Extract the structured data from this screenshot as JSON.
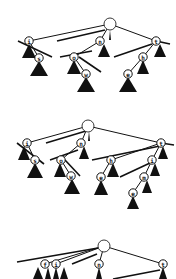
{
  "diagram": {
    "type": "trie-insertion-sequence",
    "panels": [
      {
        "id": "panel-1",
        "root": {
          "x": 110,
          "y": 24,
          "r": 6
        },
        "nodes": [
          {
            "id": "i",
            "label": "i",
            "x": 29,
            "y": 41
          },
          {
            "id": "s",
            "label": "s",
            "x": 39,
            "y": 58
          },
          {
            "id": "n",
            "label": "n",
            "x": 100,
            "y": 41
          },
          {
            "id": "o",
            "label": "o",
            "x": 74,
            "y": 57
          },
          {
            "id": "w",
            "label": "w",
            "x": 86,
            "y": 74
          },
          {
            "id": "t",
            "label": "t",
            "x": 156,
            "y": 41
          },
          {
            "id": "h",
            "label": "h",
            "x": 143,
            "y": 57
          },
          {
            "id": "e",
            "label": "e",
            "x": 128,
            "y": 74
          }
        ],
        "edges": [
          [
            "root",
            "i"
          ],
          [
            "root",
            "n"
          ],
          [
            "root",
            "t"
          ],
          [
            "i",
            "s"
          ],
          [
            "n",
            "o"
          ],
          [
            "o",
            "w"
          ],
          [
            "t",
            "h"
          ],
          [
            "h",
            "e"
          ]
        ],
        "slashes": [
          [
            18,
            41,
            52,
            57
          ],
          [
            57,
            41,
            105,
            30
          ],
          [
            60,
            57,
            92,
            51
          ],
          [
            79,
            57,
            101,
            72
          ],
          [
            114,
            57,
            152,
            44
          ],
          [
            156,
            41,
            170,
            44
          ]
        ],
        "subtrees": [
          {
            "x": 29,
            "y": 44,
            "w": 14,
            "h": 14
          },
          {
            "x": 39,
            "y": 61,
            "w": 18,
            "h": 15
          },
          {
            "x": 104,
            "y": 44,
            "w": 12,
            "h": 13
          },
          {
            "x": 74,
            "y": 60,
            "w": 14,
            "h": 14
          },
          {
            "x": 86,
            "y": 77,
            "w": 18,
            "h": 15
          },
          {
            "x": 160,
            "y": 44,
            "w": 12,
            "h": 13
          },
          {
            "x": 143,
            "y": 60,
            "w": 12,
            "h": 14
          },
          {
            "x": 128,
            "y": 77,
            "w": 18,
            "h": 15
          },
          {
            "x": 110,
            "y": 30,
            "w": 2,
            "h": 10
          }
        ]
      },
      {
        "id": "panel-2",
        "root": {
          "x": 88,
          "y": 126,
          "r": 6
        },
        "nodes": [
          {
            "id": "i",
            "label": "i",
            "x": 27,
            "y": 143
          },
          {
            "id": "s",
            "label": "s",
            "x": 35,
            "y": 160
          },
          {
            "id": "n",
            "label": "n",
            "x": 81,
            "y": 143
          },
          {
            "id": "o",
            "label": "o",
            "x": 61,
            "y": 160
          },
          {
            "id": "w",
            "label": "w",
            "x": 71,
            "y": 176
          },
          {
            "id": "t",
            "label": "t",
            "x": 161,
            "y": 143
          },
          {
            "id": "h",
            "label": "h",
            "x": 111,
            "y": 160
          },
          {
            "id": "e",
            "label": "e",
            "x": 101,
            "y": 177
          },
          {
            "id": "i2",
            "label": "i",
            "x": 152,
            "y": 160
          },
          {
            "id": "m",
            "label": "m",
            "x": 144,
            "y": 177
          },
          {
            "id": "e2",
            "label": "e",
            "x": 133,
            "y": 193
          }
        ],
        "edges": [
          [
            "root",
            "i"
          ],
          [
            "root",
            "n"
          ],
          [
            "root",
            "t"
          ],
          [
            "i",
            "s"
          ],
          [
            "n",
            "o"
          ],
          [
            "o",
            "w"
          ],
          [
            "t",
            "h"
          ],
          [
            "h",
            "e"
          ],
          [
            "t",
            "i2"
          ],
          [
            "i2",
            "m"
          ],
          [
            "m",
            "e2"
          ]
        ],
        "slashes": [
          [
            17,
            143,
            44,
            164
          ],
          [
            46,
            143,
            86,
            131
          ],
          [
            50,
            160,
            78,
            150
          ],
          [
            65,
            160,
            80,
            176
          ],
          [
            92,
            160,
            160,
            146
          ],
          [
            120,
            177,
            150,
            163
          ],
          [
            161,
            143,
            174,
            145
          ]
        ],
        "subtrees": [
          {
            "x": 24,
            "y": 146,
            "w": 12,
            "h": 14
          },
          {
            "x": 35,
            "y": 163,
            "w": 16,
            "h": 15
          },
          {
            "x": 84,
            "y": 146,
            "w": 10,
            "h": 13
          },
          {
            "x": 60,
            "y": 163,
            "w": 12,
            "h": 14
          },
          {
            "x": 72,
            "y": 179,
            "w": 16,
            "h": 15
          },
          {
            "x": 163,
            "y": 146,
            "w": 10,
            "h": 13
          },
          {
            "x": 113,
            "y": 163,
            "w": 12,
            "h": 14
          },
          {
            "x": 101,
            "y": 180,
            "w": 14,
            "h": 15
          },
          {
            "x": 155,
            "y": 163,
            "w": 10,
            "h": 13
          },
          {
            "x": 147,
            "y": 180,
            "w": 10,
            "h": 13
          },
          {
            "x": 133,
            "y": 196,
            "w": 12,
            "h": 13
          },
          {
            "x": 89,
            "y": 131,
            "w": 2,
            "h": 10
          }
        ]
      },
      {
        "id": "panel-3",
        "root": {
          "x": 104,
          "y": 246,
          "r": 6
        },
        "nodes": [
          {
            "id": "f",
            "label": "f",
            "x": 45,
            "y": 264
          },
          {
            "id": "i",
            "label": "i",
            "x": 56,
            "y": 264
          },
          {
            "id": "n",
            "label": "n",
            "x": 99,
            "y": 264
          },
          {
            "id": "t",
            "label": "t",
            "x": 163,
            "y": 264
          }
        ],
        "edges": [
          [
            "root",
            "f"
          ],
          [
            "root",
            "i"
          ],
          [
            "root",
            "n"
          ],
          [
            "root",
            "t"
          ]
        ],
        "slashes": [
          [
            17,
            262,
            98,
            248
          ],
          [
            72,
            264,
            97,
            254
          ],
          [
            113,
            279,
            160,
            270
          ]
        ],
        "subtrees": [
          {
            "x": 38,
            "y": 267,
            "w": 10,
            "h": 12
          },
          {
            "x": 48,
            "y": 267,
            "w": 6,
            "h": 12
          },
          {
            "x": 56,
            "y": 267,
            "w": 6,
            "h": 12
          },
          {
            "x": 64,
            "y": 267,
            "w": 8,
            "h": 12
          },
          {
            "x": 99,
            "y": 267,
            "w": 6,
            "h": 12
          },
          {
            "x": 163,
            "y": 267,
            "w": 8,
            "h": 12
          }
        ]
      }
    ]
  }
}
